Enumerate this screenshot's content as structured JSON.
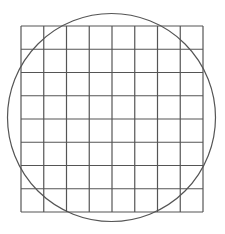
{
  "figure": {
    "width": 225,
    "height": 234,
    "background": "#ffffff",
    "stroke_color": "#555555",
    "grid": {
      "columns": 8,
      "rows": 8,
      "x0": 21,
      "y0": 26,
      "x1": 203,
      "y1": 212,
      "stroke_width": 1.2
    },
    "circle": {
      "cx": 111.5,
      "cy": 117.5,
      "r": 104,
      "stroke_width": 1.2
    }
  }
}
